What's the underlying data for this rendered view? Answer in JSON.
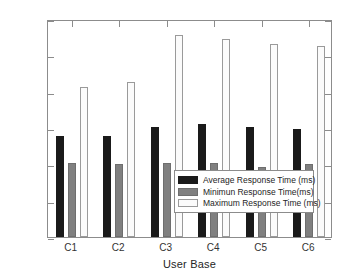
{
  "chart_data": {
    "type": "bar",
    "title": "",
    "xlabel": "User Base",
    "ylabel": "Response Time (ms)",
    "categories": [
      "C1",
      "C2",
      "C3",
      "C4",
      "C5",
      "C6"
    ],
    "series": [
      {
        "name": "Average Response Time (ms)",
        "color": "#1a1a1a",
        "values": [
          55.5,
          55.7,
          60.5,
          62.0,
          60.4,
          59.6
        ]
      },
      {
        "name": "Minimun Response Time(ms)",
        "color": "#808080",
        "values": [
          41.0,
          40.0,
          40.7,
          41.0,
          38.3,
          40.0
        ]
      },
      {
        "name": "Maximum Response Time (ms)",
        "color": "#fbfbfb",
        "values": [
          82.5,
          85.4,
          111.3,
          109.2,
          106.0,
          105.0
        ]
      }
    ],
    "ylim": [
      0,
      120
    ],
    "yticks": [
      0,
      20,
      40,
      60,
      80,
      100,
      120
    ],
    "ytick_labels": [
      "0",
      "20",
      "40",
      "60",
      "80",
      "100",
      "120"
    ],
    "grid": false,
    "legend_position": "center-right-inside"
  }
}
